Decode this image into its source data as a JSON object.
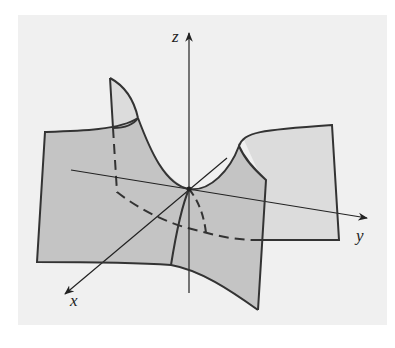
{
  "figure": {
    "axes": {
      "x_label": "x",
      "y_label": "y",
      "z_label": "z"
    },
    "colors": {
      "background": "#ffffff",
      "panel": "#f0f0f0",
      "surface_front": "#c4c4c4",
      "surface_back": "#dcdcdc",
      "line": "#333333"
    }
  }
}
